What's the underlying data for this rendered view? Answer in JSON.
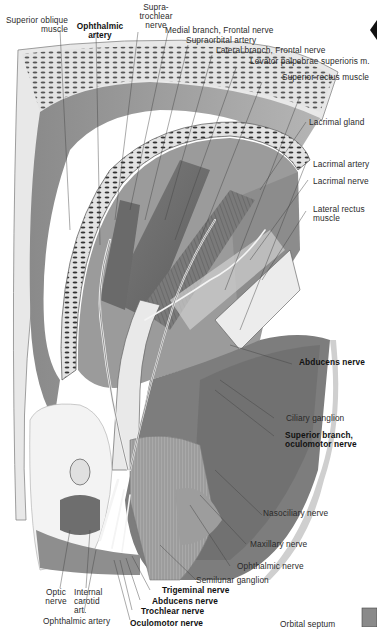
{
  "figure": {
    "colors": {
      "ink": "#2a2a2a",
      "background": "#ffffff",
      "muscle_dark": "#6f6f6f",
      "muscle_mid": "#9a9a9a",
      "bone": "#d8d8d8",
      "nerve": "#f2f2f2"
    }
  },
  "labels": {
    "superior_oblique": "Superior oblique\nmuscle",
    "ophthalmic_artery_top": "Ophthalmic\nartery",
    "supratrochlear": "Supra-\ntrochlear\nnerve",
    "medial_branch_frontal": "Medial branch, Frontal nerve",
    "supraorbital_artery": "Supraorbital artery",
    "lateral_branch_frontal": "Lateral branch, Frontal nerve",
    "levator": "Levator palpebrae superioris m.",
    "superior_rectus": "Superior rectus muscle",
    "lacrimal_gland": "Lacrimal gland",
    "lacrimal_artery": "Lacrimal artery",
    "lacrimal_nerve": "Lacrimal nerve",
    "lateral_rectus": "Lateral rectus\nmuscle",
    "abducens_right": "Abducens nerve",
    "ciliary_ganglion": "Ciliary ganglion",
    "superior_branch_oculomotor": "Superior branch,\noculomotor nerve",
    "nasociliary": "Nasociliary nerve",
    "maxillary": "Maxillary nerve",
    "ophthalmic_nerve": "Ophthalmic nerve",
    "semilunar_ganglion": "Semilunar ganglion",
    "trigeminal": "Trigeminal nerve",
    "abducens_bottom": "Abducens nerve",
    "trochlear": "Trochlear nerve",
    "oculomotor": "Oculomotor nerve",
    "optic": "Optic\nnerve",
    "internal_carotid": "Internal\ncarotid\nart.",
    "ophthalmic_artery_bottom": "Ophthalmic artery",
    "orbital_septum": "Orbital septum"
  }
}
